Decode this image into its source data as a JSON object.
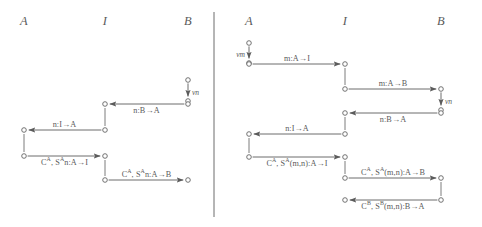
{
  "figure": {
    "type": "message-sequence-chart-pair",
    "width": 482,
    "height": 227,
    "stroke_color": "#5b5b5b",
    "background": "#ffffff",
    "divider_x": 214
  },
  "panels": [
    {
      "id": "left-panel",
      "name": "left-msc",
      "headers": [
        {
          "label": "A",
          "x": 24
        },
        {
          "label": "I",
          "x": 105
        },
        {
          "label": "B",
          "x": 188
        }
      ],
      "lifelines": [
        {
          "name": "A",
          "x": 24
        },
        {
          "name": "I",
          "x": 105
        },
        {
          "name": "B",
          "x": 188
        }
      ],
      "nu_events": [
        {
          "label": "νn",
          "x": 188,
          "y_from": 80,
          "y_to": 101,
          "side": "right"
        }
      ],
      "messages": [
        {
          "label": "n:B→A",
          "from_x": 188,
          "to_x": 105,
          "y": 104,
          "dir": "left",
          "label_pos": "below"
        },
        {
          "label": "n:I→A",
          "from_x": 105,
          "to_x": 24,
          "y": 130,
          "dir": "left",
          "label_pos": "above"
        },
        {
          "label": "C<sup>A</sup>, S<sup>A</sup>n:A→I",
          "from_x": 24,
          "to_x": 105,
          "y": 156,
          "dir": "right",
          "label_pos": "below"
        },
        {
          "label": "C<sup>A</sup>, S<sup>A</sup>n:A→B",
          "from_x": 105,
          "to_x": 188,
          "y": 180,
          "dir": "right",
          "label_pos": "above"
        }
      ],
      "lifeline_segments": [
        {
          "x": 188,
          "y1": 104,
          "y2": 104
        },
        {
          "x": 105,
          "y1": 104,
          "y2": 130
        },
        {
          "x": 24,
          "y1": 130,
          "y2": 156
        },
        {
          "x": 105,
          "y1": 156,
          "y2": 180
        }
      ]
    },
    {
      "id": "right-panel",
      "name": "right-msc",
      "headers": [
        {
          "label": "A",
          "x": 249
        },
        {
          "label": "I",
          "x": 345
        },
        {
          "label": "B",
          "x": 441
        }
      ],
      "lifelines": [
        {
          "name": "A",
          "x": 249
        },
        {
          "name": "I",
          "x": 345
        },
        {
          "name": "B",
          "x": 441
        }
      ],
      "nu_events": [
        {
          "label": "νm",
          "x": 249,
          "y_from": 43,
          "y_to": 63,
          "side": "left"
        },
        {
          "label": "νn",
          "x": 441,
          "y_from": 89,
          "y_to": 110,
          "side": "right"
        }
      ],
      "messages": [
        {
          "label": "m:A→I",
          "from_x": 249,
          "to_x": 345,
          "y": 64,
          "dir": "right",
          "label_pos": "above"
        },
        {
          "label": "m:A→B",
          "from_x": 345,
          "to_x": 441,
          "y": 89,
          "dir": "right",
          "label_pos": "above"
        },
        {
          "label": "n:B→A",
          "from_x": 441,
          "to_x": 345,
          "y": 113,
          "dir": "left",
          "label_pos": "below"
        },
        {
          "label": "n:I→A",
          "from_x": 345,
          "to_x": 249,
          "y": 134,
          "dir": "left",
          "label_pos": "above"
        },
        {
          "label": "C<sup>A</sup>, S<sup>A</sup>(m,n):A→I",
          "from_x": 249,
          "to_x": 345,
          "y": 157,
          "dir": "right",
          "label_pos": "below"
        },
        {
          "label": "C<sup>A</sup>, S<sup>A</sup>(m,n):A→B",
          "from_x": 345,
          "to_x": 441,
          "y": 178,
          "dir": "right",
          "label_pos": "above"
        },
        {
          "label": "C<sup>B</sup>, S<sup>B</sup>(m,n):B→A",
          "from_x": 441,
          "to_x": 345,
          "y": 200,
          "dir": "left",
          "label_pos": "below"
        }
      ],
      "lifeline_segments": [
        {
          "x": 345,
          "y1": 64,
          "y2": 89
        },
        {
          "x": 345,
          "y1": 113,
          "y2": 134
        },
        {
          "x": 249,
          "y1": 134,
          "y2": 157
        },
        {
          "x": 345,
          "y1": 157,
          "y2": 178
        },
        {
          "x": 441,
          "y1": 178,
          "y2": 200
        }
      ]
    }
  ]
}
